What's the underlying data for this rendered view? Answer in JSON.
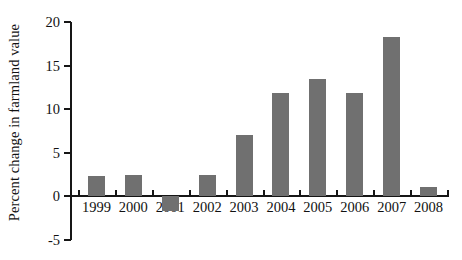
{
  "chart_data": {
    "type": "bar",
    "title": "",
    "xlabel": "",
    "ylabel": "Percent change in farmland value",
    "categories": [
      "1999",
      "2000",
      "2001",
      "2002",
      "2003",
      "2004",
      "2005",
      "2006",
      "2007",
      "2008"
    ],
    "values": [
      2.3,
      2.5,
      -1.7,
      2.5,
      7.0,
      11.9,
      13.5,
      11.9,
      18.3,
      1.1
    ],
    "ylim": [
      -5,
      20
    ],
    "yticks": [
      20,
      15,
      10,
      5,
      0,
      -5
    ],
    "ytick_labels": [
      "20",
      "15",
      "10",
      "5",
      "0",
      "-5"
    ],
    "grid": false,
    "legend": false,
    "legend_position": "none",
    "bar_color": "#707070",
    "axis_color": "#161616",
    "baseline_value": 0
  },
  "figure": {
    "title_remnant": "",
    "background": "#ffffff"
  }
}
